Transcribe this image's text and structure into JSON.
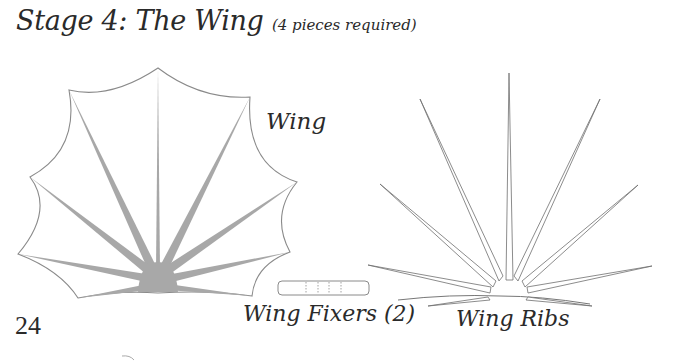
{
  "page": {
    "title": "Stage 4: The Wing",
    "title_note": "(4 pieces required)",
    "page_number": "24"
  },
  "pieces": {
    "wing": {
      "label": "Wing"
    },
    "fixers": {
      "label": "Wing Fixers (2)"
    },
    "ribs": {
      "label": "Wing Ribs"
    }
  },
  "colors": {
    "text": "#2a2a2a",
    "outline": "#8a8a8a",
    "rib_fill": "#a8a8a8",
    "fixer_dash": "#8c8c8c"
  }
}
